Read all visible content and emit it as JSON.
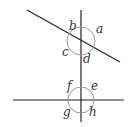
{
  "diagram": {
    "type": "angles-at-intersections",
    "lines": {
      "vertical": {
        "x": 81,
        "y1": 10,
        "y2": 122
      },
      "transversal": {
        "x1": 27,
        "y1": 10,
        "x2": 120,
        "y2": 62
      },
      "horizontal": {
        "y": 100,
        "x1": 13,
        "x2": 124
      }
    },
    "intersections": [
      {
        "name": "upper",
        "cx": 81,
        "cy": 41,
        "r": 14,
        "labels": [
          {
            "text": "a",
            "x": 96,
            "y": 33
          },
          {
            "text": "b",
            "x": 69,
            "y": 30
          },
          {
            "text": "c",
            "x": 62,
            "y": 56
          },
          {
            "text": "d",
            "x": 83,
            "y": 63
          }
        ]
      },
      {
        "name": "lower",
        "cx": 81,
        "cy": 100,
        "r": 13,
        "labels": [
          {
            "text": "e",
            "x": 91,
            "y": 90
          },
          {
            "text": "f",
            "x": 67,
            "y": 90
          },
          {
            "text": "g",
            "x": 63,
            "y": 116
          },
          {
            "text": "h",
            "x": 89,
            "y": 116
          }
        ]
      }
    ],
    "colors": {
      "line": "#222222",
      "arc": "#999999",
      "label": "#333333"
    }
  }
}
